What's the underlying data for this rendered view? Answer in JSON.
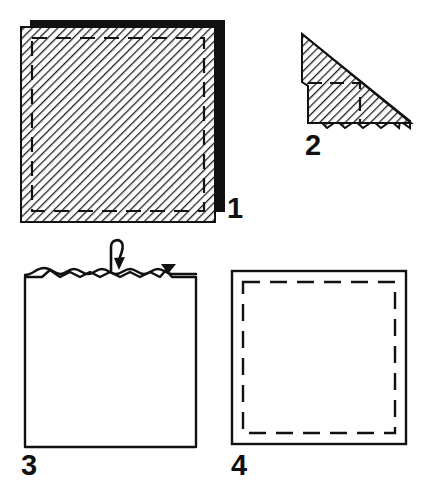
{
  "document": {
    "title": "Four-step folding instruction diagram",
    "type": "instructional-line-drawing",
    "background_color": "#ffffff",
    "ink_color": "#111111"
  },
  "steps": [
    {
      "number": "1",
      "name": "step-1",
      "caption": "Hatched square panel with dashed stitch line and solid drop shadow",
      "shape": "square",
      "fill": "diagonal-hatch",
      "inner_line": "dashed",
      "shadow": "offset-black-block"
    },
    {
      "number": "2",
      "name": "step-2",
      "caption": "Folded corner triangle with hatched face and dashed fold line",
      "shape": "triangle-wedge",
      "fill": "diagonal-hatch",
      "inner_line": "dashed"
    },
    {
      "number": "3",
      "name": "step-3",
      "caption": "Plain square with gathered wavy top edge and curved turn-down arrow",
      "shape": "square",
      "fill": "none",
      "top_edge": "wavy-gathered",
      "arrow": "hook-arrow-down",
      "marker": "solid-triangle-flag"
    },
    {
      "number": "4",
      "name": "step-4",
      "caption": "Plain square with dashed inset border",
      "shape": "square",
      "fill": "none",
      "inner_line": "dashed"
    }
  ],
  "colors": {
    "ink": "#111111",
    "shadow": "#111111",
    "paper": "#ffffff",
    "hatch": "#2b2b2b"
  }
}
